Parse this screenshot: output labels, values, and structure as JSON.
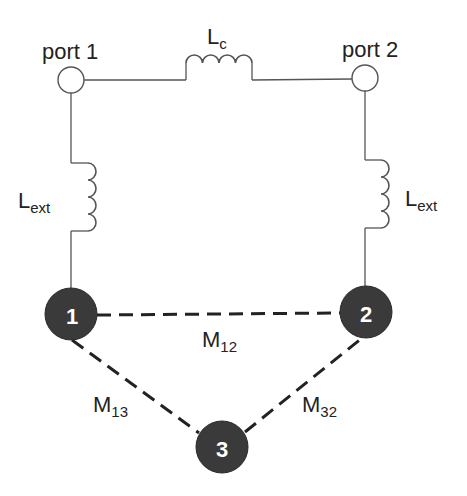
{
  "diagram": {
    "title": "",
    "ports": [
      {
        "id": "port1",
        "label": "port 1"
      },
      {
        "id": "port2",
        "label": "port 2"
      }
    ],
    "inductors": {
      "coupling": {
        "main": "L",
        "sub": "c"
      },
      "ext_left": {
        "main": "L",
        "sub": "ext"
      },
      "ext_right": {
        "main": "L",
        "sub": "ext"
      }
    },
    "resonators": [
      {
        "id": "node1",
        "label": "1"
      },
      {
        "id": "node2",
        "label": "2"
      },
      {
        "id": "node3",
        "label": "3"
      }
    ],
    "couplings": [
      {
        "id": "m12",
        "main": "M",
        "sub": "12",
        "from": "1",
        "to": "2"
      },
      {
        "id": "m13",
        "main": "M",
        "sub": "13",
        "from": "1",
        "to": "3"
      },
      {
        "id": "m32",
        "main": "M",
        "sub": "32",
        "from": "3",
        "to": "2"
      }
    ],
    "colors": {
      "wire": "#555555",
      "node_fill": "#3a3a3a",
      "node_text": "#ffffff",
      "dash": "#222222",
      "background": "#ffffff"
    }
  }
}
